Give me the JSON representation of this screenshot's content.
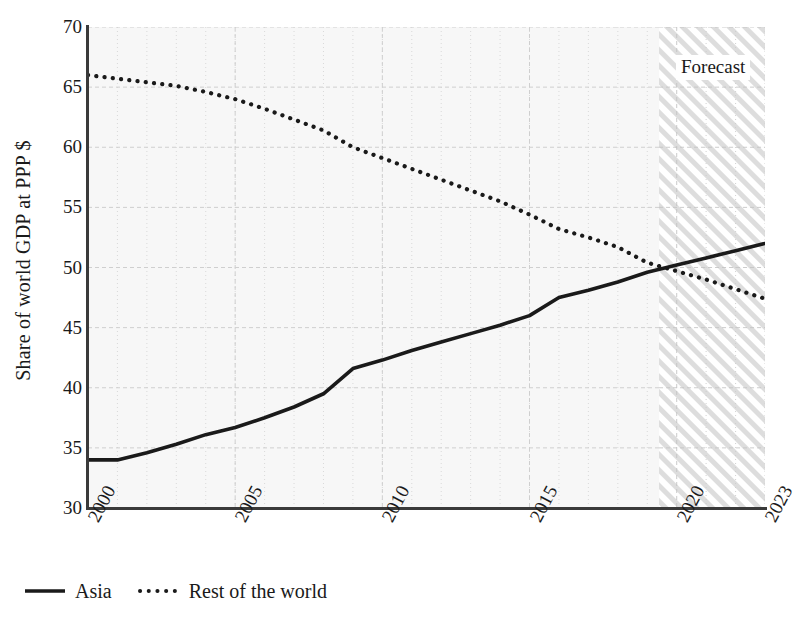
{
  "chart_data": {
    "type": "line",
    "title": "",
    "xlabel": "",
    "ylabel": "Share of world GDP at PPP $",
    "xlim": [
      2000,
      2023
    ],
    "ylim": [
      30,
      70
    ],
    "grid": true,
    "legend_position": "bottom-left",
    "y_ticks": [
      70,
      65,
      60,
      55,
      50,
      45,
      40,
      35,
      30
    ],
    "x_ticks": [
      2000,
      2005,
      2010,
      2015,
      2020,
      2023
    ],
    "x": [
      2000,
      2001,
      2002,
      2003,
      2004,
      2005,
      2006,
      2007,
      2008,
      2009,
      2010,
      2011,
      2012,
      2013,
      2014,
      2015,
      2016,
      2017,
      2018,
      2019,
      2020,
      2021,
      2022,
      2023
    ],
    "series": [
      {
        "name": "Asia",
        "style": "solid",
        "color": "#1a1a1a",
        "values": [
          34.0,
          34.0,
          34.6,
          35.3,
          36.1,
          36.7,
          37.5,
          38.4,
          39.5,
          41.6,
          42.3,
          43.1,
          43.8,
          44.5,
          45.2,
          46.0,
          47.5,
          48.1,
          48.8,
          49.6,
          50.2,
          50.8,
          51.4,
          52.0
        ]
      },
      {
        "name": "Rest of the world",
        "style": "dotted",
        "color": "#1a1a1a",
        "values": [
          66.0,
          65.7,
          65.4,
          65.1,
          64.6,
          64.0,
          63.2,
          62.3,
          61.4,
          60.0,
          59.1,
          58.2,
          57.3,
          56.4,
          55.5,
          54.4,
          53.2,
          52.5,
          51.7,
          50.4,
          49.7,
          49.0,
          48.2,
          47.4
        ]
      }
    ],
    "annotations": [
      {
        "name": "forecast-band",
        "label": "Forecast",
        "type": "shaded-hatched-region",
        "x_start": 2019.4,
        "x_end": 2023
      }
    ]
  },
  "axes": {
    "y_title": "Share of world GDP at PPP $",
    "y_tick_labels": [
      "70",
      "65",
      "60",
      "55",
      "50",
      "45",
      "40",
      "35",
      "30"
    ],
    "x_tick_labels": [
      "2000",
      "2005",
      "2010",
      "2015",
      "2020",
      "2023"
    ]
  },
  "legend": {
    "items": [
      {
        "label": "Asia",
        "key": "solid-line-key"
      },
      {
        "label": "Rest of the world",
        "key": "dotted-line-key"
      }
    ]
  },
  "forecast": {
    "label": "Forecast"
  },
  "colors": {
    "panel_background": "#f7f7f7",
    "gridline_major": "#cfcfcf",
    "gridline_minor": "#d9d9d9",
    "series_line": "#1a1a1a",
    "axis": "#3a3a3a",
    "hatch": "#d8d8d8",
    "text": "#1a1a1a"
  }
}
